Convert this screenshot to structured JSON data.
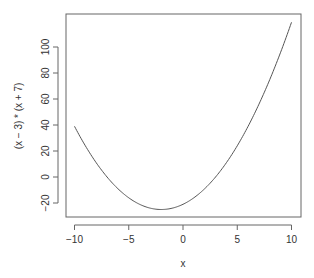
{
  "chart_data": {
    "type": "line",
    "title": "",
    "xlabel": "x",
    "ylabel": "(x − 3) * (x + 7)",
    "xlim": [
      -10,
      10
    ],
    "ylim": [
      -24,
      119
    ],
    "grid": false,
    "legend": null,
    "x_ticks": [
      "-10",
      "-5",
      "0",
      "5",
      "10"
    ],
    "x_tick_values": [
      -10,
      -5,
      0,
      5,
      10
    ],
    "y_ticks": [
      "-20",
      "0",
      "20",
      "40",
      "60",
      "80",
      "100"
    ],
    "y_tick_values": [
      -20,
      0,
      20,
      40,
      60,
      80,
      100
    ],
    "series": [
      {
        "name": "(x - 3) * (x + 7)",
        "x": [
          -10,
          -9,
          -8,
          -7,
          -6,
          -5,
          -4,
          -3,
          -2,
          -1,
          0,
          1,
          2,
          3,
          4,
          5,
          6,
          7,
          8,
          9,
          10
        ],
        "values": [
          39,
          24,
          11,
          0,
          -9,
          -16,
          -21,
          -24,
          -25,
          -24,
          -21,
          -16,
          -9,
          0,
          11,
          24,
          39,
          56,
          75,
          96,
          119
        ]
      }
    ]
  }
}
